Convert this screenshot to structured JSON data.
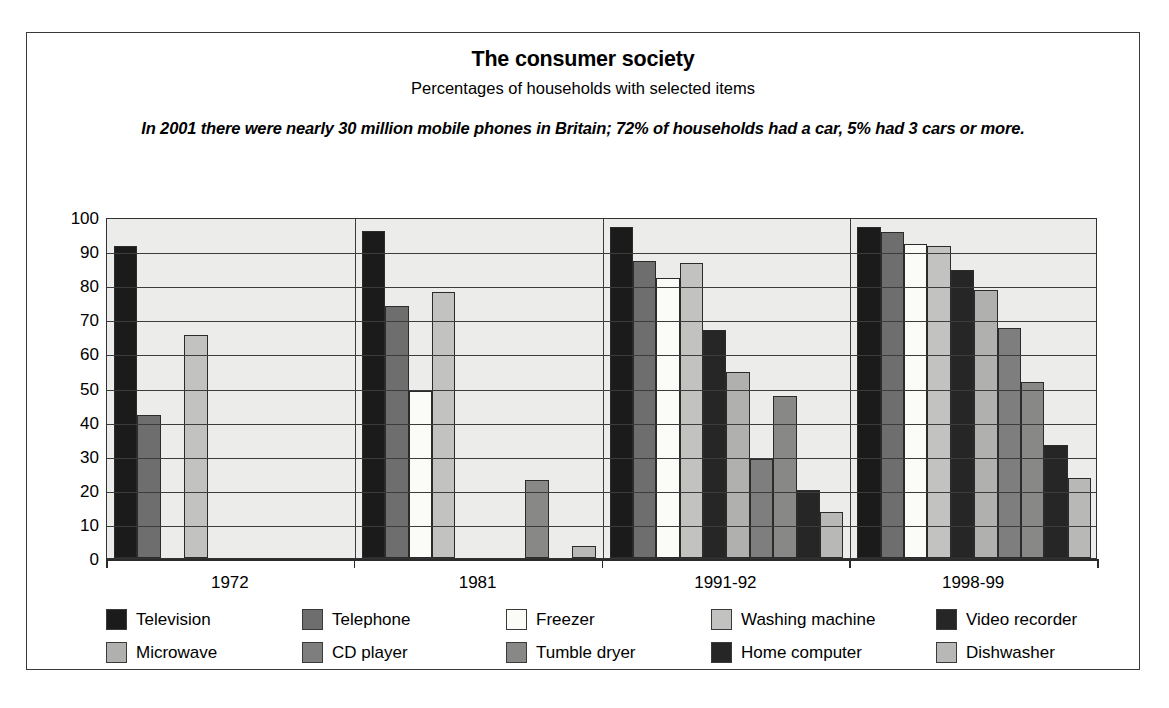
{
  "header": {
    "title": "The consumer society",
    "subtitle": "Percentages of households with selected items",
    "note": "In 2001 there were nearly 30 million mobile phones in Britain; 72% of households had a car, 5% had 3 cars or more."
  },
  "chart_data": {
    "type": "bar",
    "title": "The consumer society",
    "subtitle": "Percentages of households with selected items",
    "annotation": "In 2001 there were nearly 30 million mobile phones in Britain; 72% of households had a car, 5% had 3 cars or more.",
    "xlabel": "",
    "ylabel": "",
    "ylim": [
      0,
      100
    ],
    "yticks": [
      0,
      10,
      20,
      30,
      40,
      50,
      60,
      70,
      80,
      90,
      100
    ],
    "ytick_labels": [
      "0",
      "10",
      "20",
      "30",
      "40",
      "50",
      "60",
      "70",
      "80",
      "90",
      "100"
    ],
    "grid": true,
    "legend_position": "bottom",
    "categories": [
      "1972",
      "1981",
      "1991-92",
      "1998-99"
    ],
    "series": [
      {
        "name": "Television",
        "color": "#1b1b1b",
        "values": [
          91.5,
          96.0,
          97.0,
          97.0
        ]
      },
      {
        "name": "Telephone",
        "color": "#6e6e6e",
        "values": [
          42.0,
          74.0,
          87.0,
          95.5
        ]
      },
      {
        "name": "Freezer",
        "color": "#fbfbf8",
        "values": [
          0,
          49.0,
          82.0,
          92.0
        ]
      },
      {
        "name": "Washing machine",
        "color": "#c2c2c0",
        "values": [
          65.5,
          78.0,
          86.5,
          91.5
        ]
      },
      {
        "name": "Video recorder",
        "color": "#262626",
        "values": [
          0,
          0,
          67.0,
          84.5
        ]
      },
      {
        "name": "Microwave",
        "color": "#b0b0ae",
        "values": [
          0,
          0,
          54.5,
          78.5
        ]
      },
      {
        "name": "CD player",
        "color": "#7e7e7e",
        "values": [
          0,
          0,
          29.0,
          67.5
        ]
      },
      {
        "name": "Tumble dryer",
        "color": "#888886",
        "values": [
          0,
          23.0,
          47.5,
          51.5
        ]
      },
      {
        "name": "Home computer",
        "color": "#262626",
        "values": [
          0,
          0,
          20.0,
          33.0
        ]
      },
      {
        "name": "Dishwasher",
        "color": "#b8b8b6",
        "values": [
          0,
          3.5,
          13.5,
          23.5
        ]
      }
    ]
  },
  "legend": {
    "items": [
      {
        "label": "Television",
        "color": "#1b1b1b"
      },
      {
        "label": "Telephone",
        "color": "#6e6e6e"
      },
      {
        "label": "Freezer",
        "color": "#fbfbf8"
      },
      {
        "label": "Washing machine",
        "color": "#c2c2c0"
      },
      {
        "label": "Video recorder",
        "color": "#262626"
      },
      {
        "label": "Microwave",
        "color": "#b0b0ae"
      },
      {
        "label": "CD player",
        "color": "#7e7e7e"
      },
      {
        "label": "Tumble dryer",
        "color": "#888886"
      },
      {
        "label": "Home computer",
        "color": "#262626"
      },
      {
        "label": "Dishwasher",
        "color": "#b8b8b6"
      }
    ],
    "columns": 5,
    "rows": 2
  }
}
